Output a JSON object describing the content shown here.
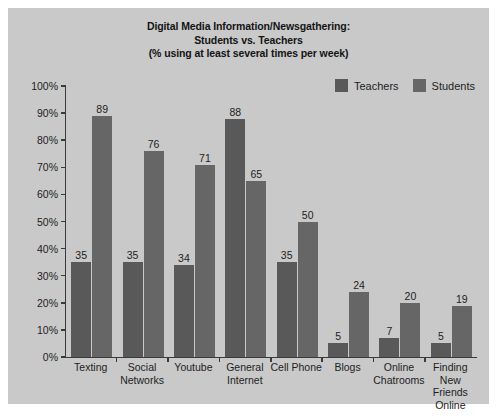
{
  "chart_data": {
    "type": "bar",
    "title": "Digital Media Information/Newsgathering: Students vs. Teachers (% using at least several times per week)",
    "title_lines": [
      "Digital Media Information/Newsgathering:",
      "Students vs. Teachers",
      "(% using at least several times per week)"
    ],
    "xlabel": "",
    "ylabel": "",
    "ylim": [
      0,
      100
    ],
    "grid": false,
    "legend_position": "top-right",
    "y_ticks": [
      "0%",
      "10%",
      "20%",
      "30%",
      "40%",
      "50%",
      "60%",
      "70%",
      "80%",
      "90%",
      "100%"
    ],
    "y_tick_values": [
      0,
      10,
      20,
      30,
      40,
      50,
      60,
      70,
      80,
      90,
      100
    ],
    "categories": [
      "Texting",
      "Social Networks",
      "Youtube",
      "General Internet",
      "Cell Phone",
      "Blogs",
      "Online Chatrooms",
      "Finding New Friends Online"
    ],
    "category_lines": [
      [
        "Texting"
      ],
      [
        "Social",
        "Networks"
      ],
      [
        "Youtube"
      ],
      [
        "General",
        "Internet"
      ],
      [
        "Cell Phone"
      ],
      [
        "Blogs"
      ],
      [
        "Online",
        "Chatrooms"
      ],
      [
        "Finding New",
        "Friends",
        "Online"
      ]
    ],
    "series": [
      {
        "name": "Teachers",
        "color": "#595959",
        "values": [
          35,
          35,
          34,
          88,
          35,
          5,
          7,
          5
        ]
      },
      {
        "name": "Students",
        "color": "#666666",
        "values": [
          89,
          76,
          71,
          65,
          50,
          24,
          20,
          19
        ]
      }
    ]
  },
  "colors": {
    "card_background": "#c9c9c9",
    "page_background": "#ffffff",
    "axis": "#3a3a3a",
    "text": "#1d1d1d",
    "teachers_bar": "#595959",
    "students_bar": "#666666"
  }
}
